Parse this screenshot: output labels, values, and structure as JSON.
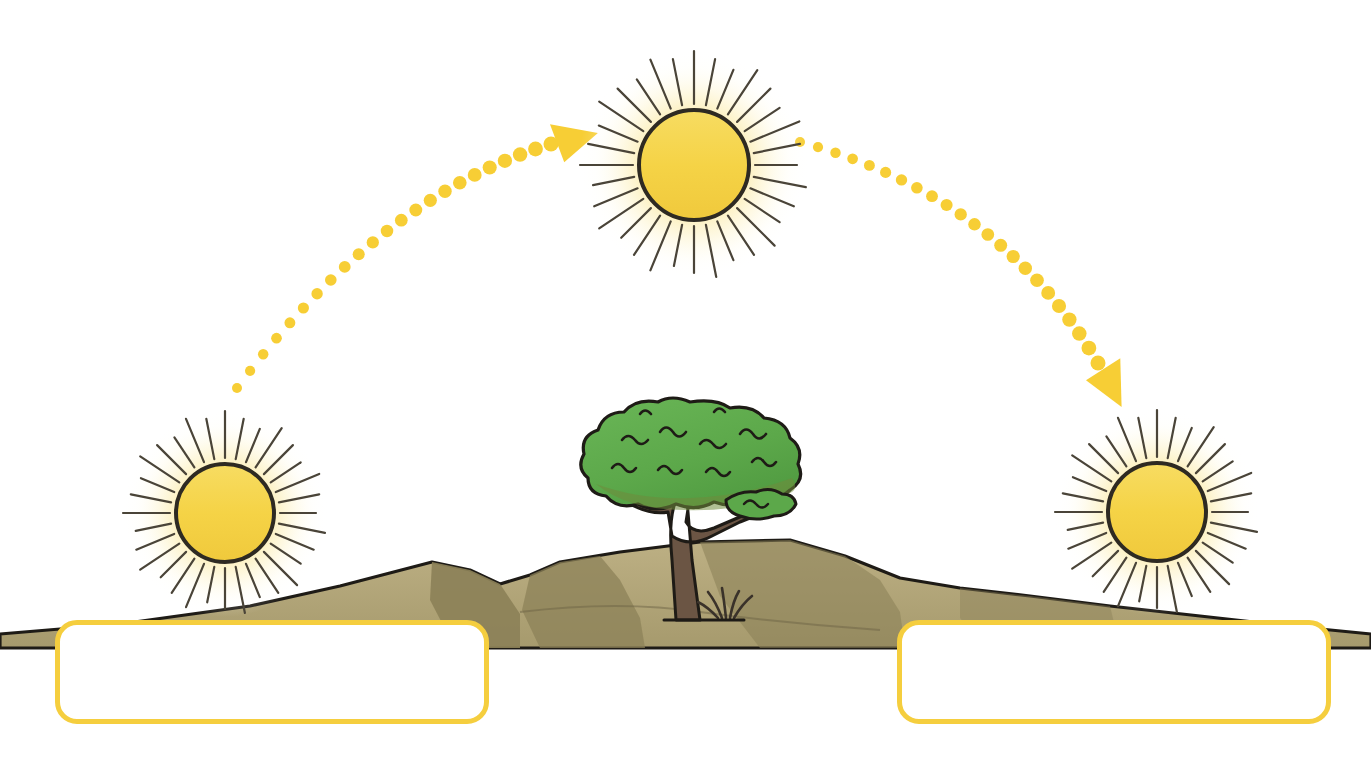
{
  "diagram": {
    "background_color": "#ffffff",
    "width": 1371,
    "height": 764
  },
  "palette": {
    "sun_disc": "#F5D547",
    "sun_disc_outline": "#2E2A22",
    "sun_glow_inner": "#FBEFA8",
    "sun_glow_outer": "#FFFFFF",
    "sun_ray": "#4A4438",
    "arrow_dot": "#F7CE35",
    "arrowhead": "#F7CE35",
    "box_border": "#F5CE3E",
    "box_fill": "#FFFFFF",
    "hill_light": "#B5A87C",
    "hill_mid": "#A09566",
    "hill_shadow": "#8A7F55",
    "hill_outline": "#1E1B16",
    "tree_canopy": "#5CA84A",
    "tree_canopy_shade": "#77893C",
    "tree_canopy_outline": "#1E1B16",
    "tree_trunk": "#6B5544",
    "tree_trunk_outline": "#1E1B16",
    "grass_tuft": "#3A322A"
  },
  "suns": [
    {
      "name": "sunrise-sun",
      "label": "",
      "cx": 225,
      "cy": 513,
      "disc_radius": 49,
      "ray_count": 32,
      "ray_inner": 55,
      "ray_outer": 96,
      "glow_radius": 104
    },
    {
      "name": "noon-sun",
      "label": "",
      "cx": 694,
      "cy": 165,
      "disc_radius": 55,
      "ray_count": 32,
      "ray_inner": 61,
      "ray_outer": 108,
      "glow_radius": 116
    },
    {
      "name": "sunset-sun",
      "label": "",
      "cx": 1157,
      "cy": 512,
      "disc_radius": 49,
      "ray_count": 32,
      "ray_inner": 55,
      "ray_outer": 96,
      "glow_radius": 104
    }
  ],
  "arrows": [
    {
      "name": "sunrise-to-noon-arrow",
      "direction": "rising",
      "dot_color": "#F7CE35",
      "dot_count": 23,
      "dot_start_radius": 5.0,
      "dot_end_radius": 7.5,
      "path_start": {
        "x": 237,
        "y": 388
      },
      "path_control": {
        "x": 380,
        "y": 196
      },
      "path_end": {
        "x": 551,
        "y": 144
      },
      "arrowhead": {
        "x": 570,
        "y": 139,
        "angle_deg": -12,
        "size": 30
      }
    },
    {
      "name": "noon-to-sunset-arrow",
      "direction": "setting",
      "dot_color": "#F7CE35",
      "dot_count": 23,
      "dot_start_radius": 5.0,
      "dot_end_radius": 7.5,
      "path_start": {
        "x": 800,
        "y": 142
      },
      "path_control": {
        "x": 1000,
        "y": 196
      },
      "path_end": {
        "x": 1098,
        "y": 363
      },
      "arrowhead": {
        "x": 1110,
        "y": 381,
        "angle_deg": 66,
        "size": 30
      }
    }
  ],
  "terrain": {
    "name": "hill-range",
    "ground_line_y": 648,
    "peaks": [
      {
        "name": "left-hill",
        "apex_x": 432,
        "apex_y": 562
      },
      {
        "name": "center-hill",
        "apex_x": 530,
        "apex_y": 575
      },
      {
        "name": "tree-hill",
        "apex_x": 790,
        "apex_y": 540
      },
      {
        "name": "right-hill",
        "apex_x": 960,
        "apex_y": 588
      }
    ]
  },
  "tree": {
    "name": "acacia-tree",
    "canopy_center": {
      "x": 690,
      "y": 460
    },
    "canopy_width": 210,
    "canopy_height": 110,
    "trunk_base": {
      "x": 688,
      "y": 620
    },
    "has_side_branch": true,
    "has_grass_tuft": true
  },
  "answer_boxes": [
    {
      "name": "answer-box-left",
      "position": "bottom-left",
      "value": "",
      "placeholder": "",
      "border_color": "#F5CE3E",
      "fill_color": "#FFFFFF"
    },
    {
      "name": "answer-box-right",
      "position": "bottom-right",
      "value": "",
      "placeholder": "",
      "border_color": "#F5CE3E",
      "fill_color": "#FFFFFF"
    }
  ]
}
